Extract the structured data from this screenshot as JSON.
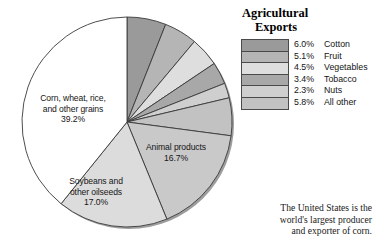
{
  "legend": {
    "title_line1": "Agricultural",
    "title_line2": "Exports",
    "items": [
      {
        "pct": "6.0%",
        "label": "Cotton",
        "color": "#9a9a9a"
      },
      {
        "pct": "5.1%",
        "label": "Fruit",
        "color": "#b5b5b5"
      },
      {
        "pct": "4.5%",
        "label": "Vegetables",
        "color": "#dedede"
      },
      {
        "pct": "3.4%",
        "label": "Tobacco",
        "color": "#a8a8a8"
      },
      {
        "pct": "2.3%",
        "label": "Nuts",
        "color": "#cfcfcf"
      },
      {
        "pct": "5.8%",
        "label": "All other",
        "color": "#c2c2c2"
      }
    ],
    "continuation_line1": "agricultural",
    "continuation_line2": "products"
  },
  "caption": {
    "line1": "The United States is the",
    "line2": "world's largest producer",
    "line3": "and exporter of corn."
  },
  "pie_labels": [
    {
      "name": "grains",
      "lines": [
        "Corn, wheat, rice,",
        "and other grains",
        "39.2%"
      ]
    },
    {
      "name": "animal",
      "lines": [
        "Animal products",
        "16.7%"
      ]
    },
    {
      "name": "soybeans",
      "lines": [
        "Soybeans and",
        "other oilseeds",
        "17.0%"
      ]
    }
  ],
  "chart_data": {
    "type": "pie",
    "title": "Agricultural Exports",
    "units": "percent of total U.S. agricultural exports",
    "start_angle_deg": 0,
    "direction": "clockwise",
    "categories": [
      "Cotton",
      "Fruit",
      "Vegetables",
      "Tobacco",
      "Nuts",
      "All other agricultural products",
      "Animal products",
      "Soybeans and other oilseeds",
      "Corn, wheat, rice, and other grains"
    ],
    "values": [
      6.0,
      5.1,
      4.5,
      3.4,
      2.3,
      5.8,
      16.7,
      17.0,
      39.2
    ],
    "colors": [
      "#9a9a9a",
      "#b5b5b5",
      "#dedede",
      "#a8a8a8",
      "#cfcfcf",
      "#c2c2c2",
      "#c9c9c9",
      "#dcdcdc",
      "#ffffff"
    ],
    "legend_position": "right",
    "labels_shown_on_slices": [
      "Corn, wheat, rice, and other grains 39.2%",
      "Animal products 16.7%",
      "Soybeans and other oilseeds 17.0%"
    ],
    "annotation": "The United States is the world's largest producer and exporter of corn."
  }
}
